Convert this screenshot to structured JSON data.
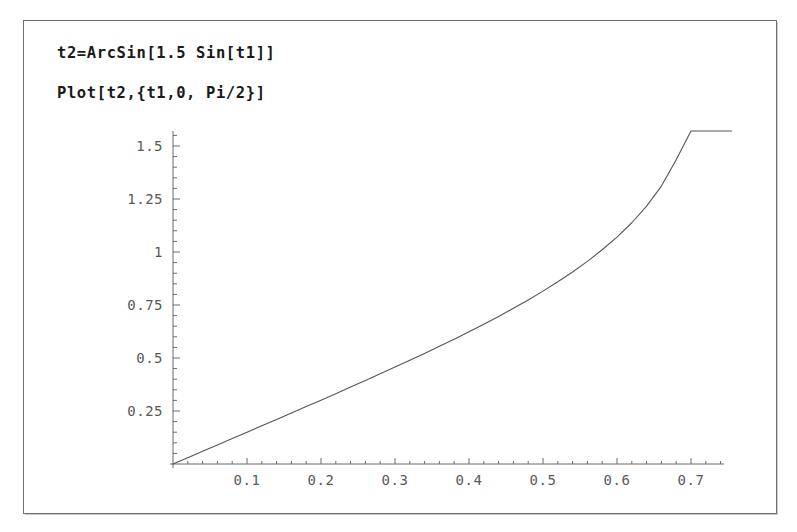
{
  "window": {
    "background_color": "#ffffff",
    "frame_border_color": "#6f6f6f"
  },
  "code": {
    "line1": "t2=ArcSin[1.5 Sin[t1]]",
    "line2": "Plot[t2,{t1,0, Pi/2}]"
  },
  "chart_data": {
    "type": "line",
    "title": "",
    "xlabel": "",
    "ylabel": "",
    "xlim": [
      0,
      0.7595
    ],
    "ylim": [
      0,
      1.5708
    ],
    "grid": false,
    "legend": null,
    "axis_color": "#6b6b6b",
    "curve_color": "#555555",
    "expression": "t2 = ArcSin[1.5 Sin[t1]]",
    "x_major_ticks": [
      0.1,
      0.2,
      0.3,
      0.4,
      0.5,
      0.6,
      0.7
    ],
    "x_major_tick_labels": [
      "0.1",
      "0.2",
      "0.3",
      "0.4",
      "0.5",
      "0.6",
      "0.7"
    ],
    "x_minor_step": 0.02,
    "y_major_ticks": [
      0.25,
      0.5,
      0.75,
      1,
      1.25,
      1.5
    ],
    "y_major_tick_labels": [
      "0.25",
      "0.5",
      "0.75",
      "1",
      "1.25",
      "1.5"
    ],
    "y_minor_step": 0.05,
    "x": [
      0,
      0.02,
      0.04,
      0.06,
      0.08,
      0.1,
      0.12,
      0.14,
      0.16,
      0.18,
      0.2,
      0.22,
      0.24,
      0.26,
      0.28,
      0.3,
      0.32,
      0.34,
      0.36,
      0.38,
      0.4,
      0.42,
      0.44,
      0.46,
      0.48,
      0.5,
      0.52,
      0.54,
      0.56,
      0.58,
      0.6,
      0.62,
      0.64,
      0.66,
      0.68,
      0.7,
      0.71,
      0.72,
      0.73,
      0.74,
      0.745,
      0.75,
      0.7525,
      0.7548
    ],
    "y": [
      0,
      0.03,
      0.06,
      0.09,
      0.12,
      0.15006,
      0.18015,
      0.21029,
      0.24051,
      0.27083,
      0.30129,
      0.33191,
      0.36275,
      0.39383,
      0.42522,
      0.45696,
      0.48913,
      0.52179,
      0.55503,
      0.58896,
      0.62369,
      0.65936,
      0.69615,
      0.73426,
      0.77394,
      0.81551,
      0.85935,
      0.90596,
      0.95601,
      1.01041,
      1.07042,
      1.13799,
      1.21624,
      1.31087,
      1.43467,
      1.5708,
      1.5708,
      1.5708,
      1.5708,
      1.5708,
      1.5708,
      1.5708,
      1.5708,
      1.5708
    ]
  }
}
